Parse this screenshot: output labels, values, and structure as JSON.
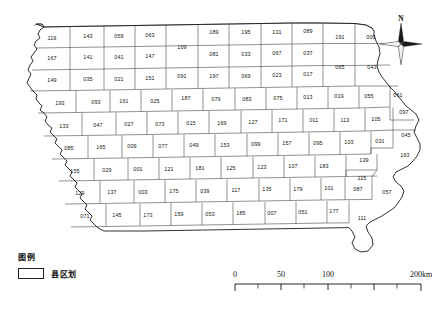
{
  "map": {
    "title": "Iowa county division map",
    "legend": {
      "heading": "图例",
      "items": [
        {
          "label": "县区划",
          "swatch_fill": "#ffffff",
          "swatch_stroke": "#222222"
        }
      ]
    },
    "compass": {
      "north_label": "N"
    },
    "scalebar": {
      "unit_label": "200km",
      "ticks": [
        "0",
        "50",
        "100",
        "200km"
      ],
      "tick_values": [
        0,
        50,
        100,
        200
      ]
    },
    "colors": {
      "county_fill": "#ffffff",
      "county_stroke": "#3a3a3a",
      "state_stroke": "#1a1a1a",
      "label_text": "#141414"
    },
    "rows": [
      {
        "row": 1,
        "codes": [
          "119",
          "143",
          "059",
          "063",
          "109",
          "189",
          "195",
          "131",
          "089",
          "191",
          "005"
        ]
      },
      {
        "row": 2,
        "codes": [
          "167",
          "141",
          "041",
          "147",
          "081",
          "033",
          "067",
          "037",
          "065",
          "043"
        ]
      },
      {
        "row": 3,
        "codes": [
          "149",
          "035",
          "021",
          "151",
          "091",
          "197",
          "069",
          "023",
          "017"
        ]
      },
      {
        "row": 4,
        "codes": [
          "193",
          "093",
          "161",
          "025",
          "187",
          "079",
          "083",
          "075",
          "013",
          "019",
          "055",
          "061"
        ]
      },
      {
        "row": 5,
        "codes": [
          "133",
          "047",
          "027",
          "073",
          "015",
          "169",
          "127",
          "171",
          "011",
          "113",
          "105",
          "097"
        ]
      },
      {
        "row": 6,
        "codes": [
          "085",
          "165",
          "009",
          "077",
          "049",
          "153",
          "099",
          "157",
          "095",
          "103",
          "031",
          "045",
          "163"
        ]
      },
      {
        "row": 7,
        "codes": [
          "155",
          "029",
          "001",
          "121",
          "181",
          "125",
          "123",
          "107",
          "183",
          "139"
        ]
      },
      {
        "row": 8,
        "codes": [
          "129",
          "137",
          "003",
          "175",
          "039",
          "117",
          "135",
          "179",
          "101",
          "087",
          "115",
          "057"
        ]
      },
      {
        "row": 9,
        "codes": [
          "071",
          "145",
          "173",
          "159",
          "053",
          "185",
          "007",
          "051",
          "177",
          "111"
        ]
      }
    ],
    "counties": [
      {
        "code": "119",
        "x": 52,
        "y": 39
      },
      {
        "code": "143",
        "x": 88,
        "y": 37
      },
      {
        "code": "059",
        "x": 119,
        "y": 37
      },
      {
        "code": "063",
        "x": 150,
        "y": 36
      },
      {
        "code": "109",
        "x": 182,
        "y": 48
      },
      {
        "code": "189",
        "x": 214,
        "y": 33
      },
      {
        "code": "195",
        "x": 246,
        "y": 33
      },
      {
        "code": "131",
        "x": 277,
        "y": 33
      },
      {
        "code": "089",
        "x": 308,
        "y": 32
      },
      {
        "code": "191",
        "x": 340,
        "y": 38
      },
      {
        "code": "005",
        "x": 371,
        "y": 38
      },
      {
        "code": "167",
        "x": 52,
        "y": 59
      },
      {
        "code": "141",
        "x": 88,
        "y": 58
      },
      {
        "code": "041",
        "x": 119,
        "y": 58
      },
      {
        "code": "147",
        "x": 150,
        "y": 57
      },
      {
        "code": "081",
        "x": 214,
        "y": 55
      },
      {
        "code": "033",
        "x": 246,
        "y": 55
      },
      {
        "code": "067",
        "x": 277,
        "y": 54
      },
      {
        "code": "037",
        "x": 308,
        "y": 54
      },
      {
        "code": "065",
        "x": 340,
        "y": 68
      },
      {
        "code": "043",
        "x": 372,
        "y": 68
      },
      {
        "code": "149",
        "x": 52,
        "y": 81
      },
      {
        "code": "035",
        "x": 88,
        "y": 80
      },
      {
        "code": "021",
        "x": 119,
        "y": 80
      },
      {
        "code": "151",
        "x": 150,
        "y": 79
      },
      {
        "code": "091",
        "x": 182,
        "y": 77
      },
      {
        "code": "197",
        "x": 214,
        "y": 77
      },
      {
        "code": "069",
        "x": 246,
        "y": 77
      },
      {
        "code": "023",
        "x": 277,
        "y": 76
      },
      {
        "code": "017",
        "x": 308,
        "y": 75
      },
      {
        "code": "193",
        "x": 60,
        "y": 104
      },
      {
        "code": "093",
        "x": 96,
        "y": 103
      },
      {
        "code": "161",
        "x": 124,
        "y": 102
      },
      {
        "code": "025",
        "x": 155,
        "y": 102
      },
      {
        "code": "187",
        "x": 186,
        "y": 99
      },
      {
        "code": "079",
        "x": 216,
        "y": 100
      },
      {
        "code": "083",
        "x": 247,
        "y": 100
      },
      {
        "code": "075",
        "x": 278,
        "y": 99
      },
      {
        "code": "013",
        "x": 308,
        "y": 98
      },
      {
        "code": "019",
        "x": 339,
        "y": 97
      },
      {
        "code": "055",
        "x": 369,
        "y": 97
      },
      {
        "code": "061",
        "x": 398,
        "y": 96
      },
      {
        "code": "133",
        "x": 64,
        "y": 127
      },
      {
        "code": "047",
        "x": 98,
        "y": 126
      },
      {
        "code": "027",
        "x": 129,
        "y": 125
      },
      {
        "code": "073",
        "x": 160,
        "y": 125
      },
      {
        "code": "015",
        "x": 191,
        "y": 124
      },
      {
        "code": "169",
        "x": 222,
        "y": 124
      },
      {
        "code": "127",
        "x": 253,
        "y": 123
      },
      {
        "code": "171",
        "x": 283,
        "y": 121
      },
      {
        "code": "011",
        "x": 314,
        "y": 121
      },
      {
        "code": "113",
        "x": 345,
        "y": 121
      },
      {
        "code": "105",
        "x": 376,
        "y": 120
      },
      {
        "code": "097",
        "x": 404,
        "y": 113
      },
      {
        "code": "085",
        "x": 69,
        "y": 149
      },
      {
        "code": "165",
        "x": 101,
        "y": 148
      },
      {
        "code": "009",
        "x": 132,
        "y": 147
      },
      {
        "code": "077",
        "x": 163,
        "y": 147
      },
      {
        "code": "049",
        "x": 194,
        "y": 146
      },
      {
        "code": "153",
        "x": 225,
        "y": 146
      },
      {
        "code": "099",
        "x": 256,
        "y": 145
      },
      {
        "code": "157",
        "x": 287,
        "y": 144
      },
      {
        "code": "095",
        "x": 318,
        "y": 144
      },
      {
        "code": "103",
        "x": 349,
        "y": 143
      },
      {
        "code": "031",
        "x": 380,
        "y": 142
      },
      {
        "code": "045",
        "x": 406,
        "y": 136
      },
      {
        "code": "163",
        "x": 405,
        "y": 156
      },
      {
        "code": "155",
        "x": 75,
        "y": 172
      },
      {
        "code": "029",
        "x": 107,
        "y": 171
      },
      {
        "code": "001",
        "x": 138,
        "y": 170
      },
      {
        "code": "121",
        "x": 169,
        "y": 170
      },
      {
        "code": "181",
        "x": 200,
        "y": 169
      },
      {
        "code": "125",
        "x": 231,
        "y": 169
      },
      {
        "code": "123",
        "x": 262,
        "y": 168
      },
      {
        "code": "107",
        "x": 293,
        "y": 167
      },
      {
        "code": "183",
        "x": 324,
        "y": 167
      },
      {
        "code": "139",
        "x": 364,
        "y": 161
      },
      {
        "code": "115",
        "x": 362,
        "y": 179
      },
      {
        "code": "129",
        "x": 80,
        "y": 194
      },
      {
        "code": "137",
        "x": 112,
        "y": 193
      },
      {
        "code": "003",
        "x": 143,
        "y": 193
      },
      {
        "code": "175",
        "x": 174,
        "y": 192
      },
      {
        "code": "039",
        "x": 205,
        "y": 192
      },
      {
        "code": "117",
        "x": 236,
        "y": 191
      },
      {
        "code": "135",
        "x": 267,
        "y": 190
      },
      {
        "code": "179",
        "x": 298,
        "y": 190
      },
      {
        "code": "101",
        "x": 329,
        "y": 189
      },
      {
        "code": "087",
        "x": 358,
        "y": 190
      },
      {
        "code": "057",
        "x": 387,
        "y": 193
      },
      {
        "code": "071",
        "x": 85,
        "y": 217
      },
      {
        "code": "145",
        "x": 117,
        "y": 216
      },
      {
        "code": "173",
        "x": 148,
        "y": 216
      },
      {
        "code": "159",
        "x": 179,
        "y": 215
      },
      {
        "code": "053",
        "x": 210,
        "y": 215
      },
      {
        "code": "185",
        "x": 241,
        "y": 214
      },
      {
        "code": "007",
        "x": 272,
        "y": 214
      },
      {
        "code": "051",
        "x": 303,
        "y": 213
      },
      {
        "code": "177",
        "x": 334,
        "y": 212
      },
      {
        "code": "111",
        "x": 362,
        "y": 219
      }
    ]
  }
}
